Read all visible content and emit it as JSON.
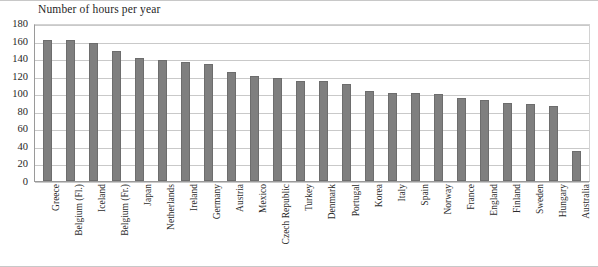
{
  "chart_data": {
    "type": "bar",
    "title": "Number of hours per year",
    "xlabel": "",
    "ylabel": "",
    "ylim": [
      0,
      180
    ],
    "ytick_step": 20,
    "yticks": [
      180,
      160,
      140,
      120,
      100,
      80,
      60,
      40,
      20,
      0
    ],
    "grid": true,
    "legend": false,
    "bar_color": "#7f7f7f",
    "gridline_color": "#c9c9c9",
    "categories": [
      "Greece",
      "Belgium (Fl.)",
      "Iceland",
      "Belgium (Fr.)",
      "Japan",
      "Netherlands",
      "Ireland",
      "Germany",
      "Austria",
      "Mexico",
      "Czech Republic",
      "Turkey",
      "Denmark",
      "Portugal",
      "Korea",
      "Italy",
      "Spain",
      "Norway",
      "France",
      "England",
      "Finland",
      "Sweden",
      "Hungary",
      "Australia"
    ],
    "values": [
      161,
      161,
      157,
      148,
      140,
      138,
      136,
      133,
      124,
      120,
      117,
      114,
      114,
      110,
      102,
      100,
      100,
      99,
      95,
      92,
      89,
      88,
      86,
      34
    ]
  }
}
